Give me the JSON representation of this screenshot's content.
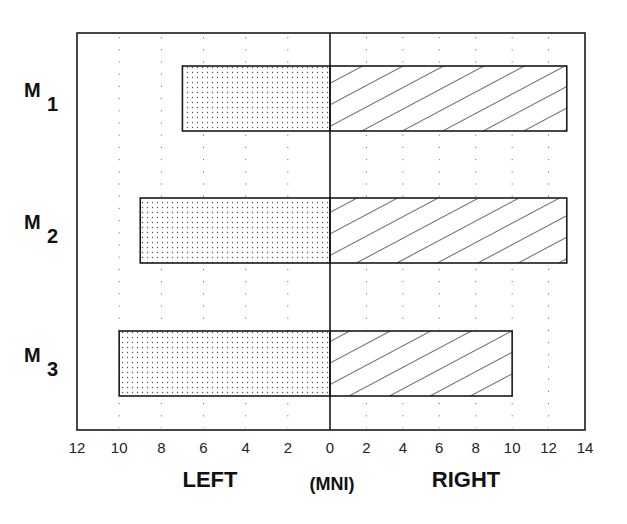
{
  "chart_data": {
    "type": "bar",
    "orientation": "horizontal-diverging",
    "title": "",
    "categories": [
      "M1",
      "M2",
      "M3"
    ],
    "category_labels": [
      {
        "main": "M",
        "sub": "1"
      },
      {
        "main": "M",
        "sub": "2"
      },
      {
        "main": "M",
        "sub": "3"
      }
    ],
    "series": [
      {
        "name": "LEFT",
        "pattern": "dotted",
        "values": [
          7,
          9,
          10
        ]
      },
      {
        "name": "RIGHT",
        "pattern": "diagonal-hatch",
        "values": [
          13,
          13,
          10
        ]
      }
    ],
    "xlabel_left": "LEFT",
    "xlabel_center": "(MNI)",
    "xlabel_right": "RIGHT",
    "left_ticks": [
      "12",
      "10",
      "8",
      "6",
      "4",
      "2",
      "0"
    ],
    "right_ticks": [
      "2",
      "4",
      "6",
      "8",
      "10",
      "12",
      "14"
    ],
    "xlim_left": [
      12,
      0
    ],
    "xlim_right": [
      0,
      14
    ],
    "grid": "vertical dotted",
    "legend": "none"
  },
  "colors": {
    "line": "#1a1a1a",
    "grid": "#777777",
    "background": "#ffffff"
  }
}
